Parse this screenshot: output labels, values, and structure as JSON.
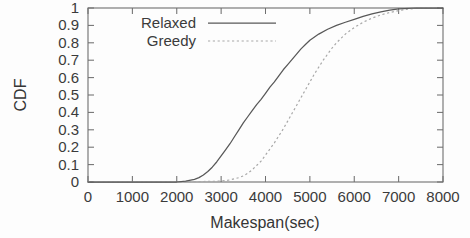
{
  "chart_data": {
    "type": "line",
    "title": "",
    "xlabel": "Makespan(sec)",
    "ylabel": "CDF",
    "xlim": [
      0,
      8000
    ],
    "ylim": [
      0,
      1
    ],
    "grid": false,
    "legend_position": "top-left-inside",
    "xticks": [
      0,
      1000,
      2000,
      3000,
      4000,
      5000,
      6000,
      7000,
      8000
    ],
    "xtick_labels": [
      "0",
      "1000",
      "2000",
      "3000",
      "4000",
      "5000",
      "6000",
      "7000",
      "8000"
    ],
    "yticks": [
      0,
      0.1,
      0.2,
      0.3,
      0.4,
      0.5,
      0.6,
      0.7,
      0.8,
      0.9,
      1
    ],
    "ytick_labels": [
      "0",
      "0.1",
      "0.2",
      "0.3",
      "0.4",
      "0.5",
      "0.6",
      "0.7",
      "0.8",
      "0.9",
      "1"
    ],
    "series": [
      {
        "name": "Relaxed",
        "style": "solid",
        "color": "#585858",
        "x": [
          0,
          1000,
          2000,
          2200,
          2400,
          2500,
          2600,
          2700,
          2800,
          2900,
          3000,
          3100,
          3200,
          3300,
          3400,
          3500,
          3600,
          3700,
          3800,
          3900,
          4000,
          4100,
          4200,
          4300,
          4400,
          4500,
          4600,
          4700,
          4800,
          4900,
          5000,
          5200,
          5400,
          5600,
          5800,
          6000,
          6200,
          6400,
          6600,
          6800,
          7000,
          7400,
          8000
        ],
        "y": [
          0,
          0,
          0,
          0.005,
          0.015,
          0.025,
          0.04,
          0.06,
          0.085,
          0.115,
          0.15,
          0.185,
          0.22,
          0.26,
          0.3,
          0.34,
          0.375,
          0.41,
          0.445,
          0.475,
          0.51,
          0.545,
          0.575,
          0.61,
          0.645,
          0.675,
          0.705,
          0.735,
          0.765,
          0.79,
          0.815,
          0.85,
          0.878,
          0.9,
          0.918,
          0.935,
          0.952,
          0.966,
          0.978,
          0.988,
          0.995,
          1,
          1
        ]
      },
      {
        "name": "Greedy",
        "style": "dotted",
        "color": "#a8a8a8",
        "x": [
          0,
          1000,
          2000,
          3000,
          3200,
          3400,
          3500,
          3600,
          3700,
          3800,
          3900,
          4000,
          4100,
          4200,
          4300,
          4400,
          4500,
          4600,
          4700,
          4800,
          4900,
          5000,
          5100,
          5200,
          5300,
          5400,
          5500,
          5600,
          5800,
          6000,
          6200,
          6400,
          6600,
          6800,
          7000,
          7200,
          7500,
          8000
        ],
        "y": [
          0,
          0,
          0,
          0.005,
          0.012,
          0.025,
          0.035,
          0.05,
          0.07,
          0.095,
          0.12,
          0.155,
          0.19,
          0.225,
          0.265,
          0.305,
          0.35,
          0.395,
          0.44,
          0.485,
          0.53,
          0.575,
          0.62,
          0.66,
          0.7,
          0.735,
          0.77,
          0.8,
          0.85,
          0.888,
          0.918,
          0.942,
          0.96,
          0.974,
          0.985,
          0.993,
          1,
          1
        ]
      }
    ]
  },
  "legend": {
    "entries": [
      {
        "label": "Relaxed",
        "style": "solid"
      },
      {
        "label": "Greedy",
        "style": "dotted"
      }
    ]
  }
}
